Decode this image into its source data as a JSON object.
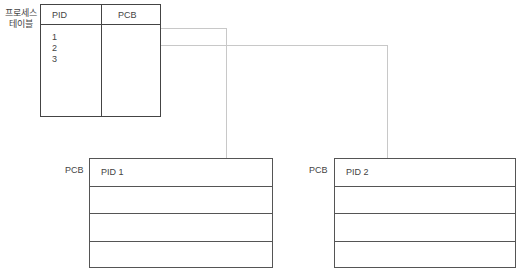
{
  "process_table": {
    "label_line1": "프로세스",
    "label_line2": "테이블",
    "headers": [
      "PID",
      "PCB"
    ],
    "pids": [
      "1",
      "2",
      "3"
    ]
  },
  "pcbs": [
    {
      "side_label": "PCB",
      "rows": [
        "PID 1",
        "",
        "",
        ""
      ]
    },
    {
      "side_label": "PCB",
      "rows": [
        "PID 2",
        "",
        "",
        ""
      ]
    }
  ],
  "colors": {
    "border": "#444444",
    "connector": "#c8c8c8",
    "text": "#444444"
  }
}
